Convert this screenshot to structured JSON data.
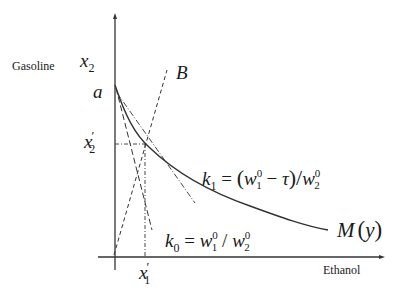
{
  "axes": {
    "y_label": "Gasoline",
    "x_label": "Ethanol",
    "y_var": "x",
    "y_var_sub": "2",
    "x_tick_var": "x",
    "x_tick_sub": "1",
    "y_tick_var": "x",
    "y_tick_sub": "2",
    "prime": "′"
  },
  "points": {
    "a": "a",
    "B": "B"
  },
  "labels": {
    "k1": {
      "k": "k",
      "sub": "1",
      "eq": " = ",
      "lp": "(",
      "w": "w",
      "sup0": "0",
      "sub1": "1",
      "minus": " − ",
      "tau": "τ",
      "rp": ")",
      "slash": "/",
      "w2": "w",
      "sub2": "2"
    },
    "k0": {
      "k": "k",
      "sub": "0",
      "eq": " = ",
      "w": "w",
      "sup0": "0",
      "sub1": "1",
      "slash": " / ",
      "w2": "w",
      "sub2": "2"
    },
    "curve": {
      "M": "M",
      "lp": "(",
      "y": "y",
      "rp": ")"
    }
  },
  "colors": {
    "line": "#333333",
    "background": "#ffffff"
  }
}
